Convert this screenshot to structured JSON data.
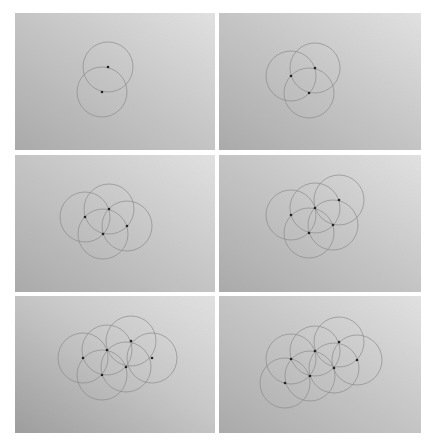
{
  "figure": {
    "layout": {
      "rows": 3,
      "cols": 2
    },
    "colors": {
      "background": "#ffffff",
      "paper_light": "#e4e4e4",
      "paper_dark": "#a8a8a8",
      "circle_stroke": "#8a8a8a",
      "dot": "#222222"
    },
    "panels": [
      {
        "step": 1,
        "label": "Step 1: two circles",
        "rect": {
          "x": 15,
          "y": 13,
          "w": 200,
          "h": 137
        },
        "radius": 25,
        "centers": [
          [
            108,
            67
          ],
          [
            102,
            92
          ]
        ],
        "dots": [
          [
            108,
            67
          ],
          [
            102,
            92
          ]
        ]
      },
      {
        "step": 2,
        "label": "Step 2: three circles",
        "rect": {
          "x": 219,
          "y": 13,
          "w": 202,
          "h": 137
        },
        "radius": 25,
        "centers": [
          [
            291,
            76
          ],
          [
            315,
            68
          ],
          [
            309,
            93
          ]
        ],
        "dots": [
          [
            291,
            76
          ],
          [
            315,
            68
          ],
          [
            309,
            93
          ]
        ]
      },
      {
        "step": 3,
        "label": "Step 3: four circles",
        "rect": {
          "x": 15,
          "y": 155,
          "w": 200,
          "h": 137
        },
        "radius": 25,
        "centers": [
          [
            85,
            217
          ],
          [
            109,
            209
          ],
          [
            103,
            234
          ],
          [
            127,
            226
          ]
        ],
        "dots": [
          [
            85,
            217
          ],
          [
            109,
            209
          ],
          [
            103,
            234
          ],
          [
            127,
            226
          ]
        ]
      },
      {
        "step": 4,
        "label": "Step 4: five circles",
        "rect": {
          "x": 219,
          "y": 155,
          "w": 202,
          "h": 137
        },
        "radius": 25,
        "centers": [
          [
            291,
            215
          ],
          [
            315,
            208
          ],
          [
            339,
            200
          ],
          [
            333,
            225
          ],
          [
            309,
            233
          ]
        ],
        "dots": [
          [
            291,
            215
          ],
          [
            315,
            208
          ],
          [
            339,
            200
          ],
          [
            333,
            225
          ],
          [
            309,
            233
          ]
        ]
      },
      {
        "step": 5,
        "label": "Step 5: six circles",
        "rect": {
          "x": 15,
          "y": 296,
          "w": 200,
          "h": 137
        },
        "radius": 25,
        "centers": [
          [
            83,
            358
          ],
          [
            107,
            350
          ],
          [
            131,
            341
          ],
          [
            152,
            358
          ],
          [
            126,
            367
          ],
          [
            102,
            375
          ]
        ],
        "dots": [
          [
            83,
            358
          ],
          [
            107,
            350
          ],
          [
            131,
            341
          ],
          [
            152,
            358
          ],
          [
            126,
            367
          ],
          [
            102,
            375
          ]
        ]
      },
      {
        "step": 6,
        "label": "Step 6: seven circles",
        "rect": {
          "x": 219,
          "y": 296,
          "w": 202,
          "h": 137
        },
        "radius": 25,
        "centers": [
          [
            291,
            359
          ],
          [
            315,
            351
          ],
          [
            339,
            342
          ],
          [
            357,
            360
          ],
          [
            334,
            368
          ],
          [
            310,
            376
          ],
          [
            285,
            383
          ]
        ],
        "dots": [
          [
            291,
            359
          ],
          [
            315,
            351
          ],
          [
            339,
            342
          ],
          [
            357,
            360
          ],
          [
            334,
            368
          ],
          [
            310,
            376
          ],
          [
            285,
            383
          ]
        ]
      }
    ]
  }
}
